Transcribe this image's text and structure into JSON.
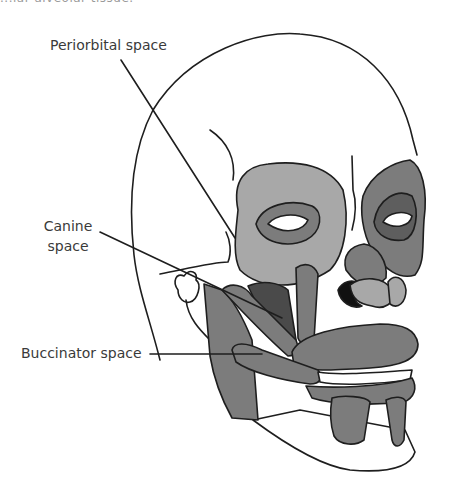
{
  "figure": {
    "caption_fragment": "...lar alveolar tissue.",
    "colors": {
      "outline": "#1e1e1e",
      "light_gray": "#a8a8a8",
      "mid_gray": "#7c7c7c",
      "dark_gray": "#4a4a4a",
      "black": "#111111",
      "bone": "#ffffff"
    },
    "labels": [
      {
        "id": "periorbital",
        "text": "Periorbital space"
      },
      {
        "id": "canine",
        "lines": [
          "Canine",
          "space"
        ]
      },
      {
        "id": "buccinator",
        "text": "Buccinator space"
      }
    ]
  }
}
